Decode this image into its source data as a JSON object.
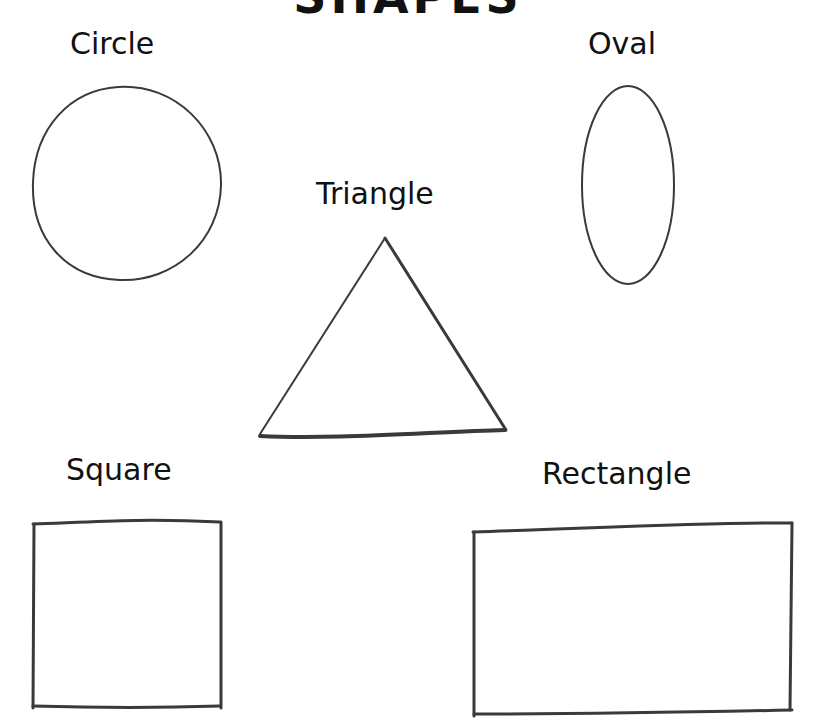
{
  "title": "SHAPES",
  "shapes": [
    {
      "name": "circle",
      "label": "Circle"
    },
    {
      "name": "oval",
      "label": "Oval"
    },
    {
      "name": "triangle",
      "label": "Triangle"
    },
    {
      "name": "square",
      "label": "Square"
    },
    {
      "name": "rectangle",
      "label": "Rectangle"
    }
  ],
  "colors": {
    "ink": "#3a3a3a",
    "paper": "#ffffff"
  }
}
